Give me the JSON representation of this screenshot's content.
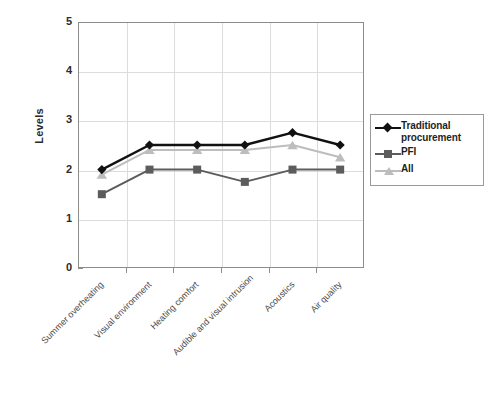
{
  "chart_data": {
    "type": "line",
    "title": "",
    "xlabel": "",
    "ylabel": "Levels",
    "ylim": [
      0,
      5
    ],
    "yticks": [
      0,
      1,
      2,
      3,
      4,
      5
    ],
    "grid": true,
    "legend_position": "right",
    "categories": [
      "Summer overheating",
      "Visual environment",
      "Heating comfort",
      "Audible and visual intrusion",
      "Acoustics",
      "Air quality"
    ],
    "series": [
      {
        "name": "Traditional procurement",
        "color": "#111111",
        "marker": "diamond",
        "values": [
          2.0,
          2.5,
          2.5,
          2.5,
          2.75,
          2.5
        ]
      },
      {
        "name": "PFI",
        "color": "#5c5c5c",
        "marker": "square",
        "values": [
          1.5,
          2.0,
          2.0,
          1.75,
          2.0,
          2.0
        ]
      },
      {
        "name": "All",
        "color": "#bdbdbd",
        "marker": "triangle",
        "values": [
          1.9,
          2.4,
          2.4,
          2.4,
          2.5,
          2.25
        ]
      }
    ]
  },
  "axis": {
    "y_title": "Levels",
    "y_tick_labels": [
      "5",
      "4",
      "3",
      "2",
      "1",
      "0"
    ]
  },
  "legend": {
    "items": [
      {
        "label": "Traditional procurement",
        "color": "#111111",
        "marker": "diamond"
      },
      {
        "label": "PFI",
        "color": "#5c5c5c",
        "marker": "square"
      },
      {
        "label": "All",
        "color": "#bdbdbd",
        "marker": "triangle"
      }
    ]
  }
}
